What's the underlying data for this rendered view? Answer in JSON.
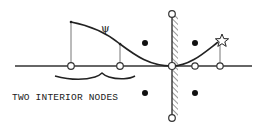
{
  "diagram": {
    "label": "TWO INTERIOR NODES",
    "curve_symbol": "ψ",
    "colors": {
      "ink": "#222222",
      "background": "#ffffff",
      "line": "#333333",
      "stem": "#777777"
    },
    "axis": {
      "y": 66,
      "x_start": 15,
      "x_end": 252
    },
    "wall": {
      "x": 172,
      "y_top": 14,
      "y_bottom": 118,
      "hatched": true
    },
    "interior_nodes": [
      {
        "x": 71,
        "y": 66,
        "curve_y": 22
      },
      {
        "x": 120,
        "y": 66,
        "curve_y": 44
      }
    ],
    "axis_nodes": [
      {
        "x": 172,
        "y": 66
      },
      {
        "x": 195,
        "y": 66
      },
      {
        "x": 220,
        "y": 66
      }
    ],
    "wall_end_nodes": [
      {
        "x": 172,
        "y": 14
      },
      {
        "x": 172,
        "y": 118
      }
    ],
    "filled_dots": [
      {
        "x": 145,
        "y": 43
      },
      {
        "x": 195,
        "y": 43
      },
      {
        "x": 145,
        "y": 93
      },
      {
        "x": 195,
        "y": 93
      }
    ],
    "star": {
      "x": 220,
      "y": 40
    },
    "brace": {
      "x_start": 55,
      "x_end": 135,
      "y": 78
    }
  }
}
